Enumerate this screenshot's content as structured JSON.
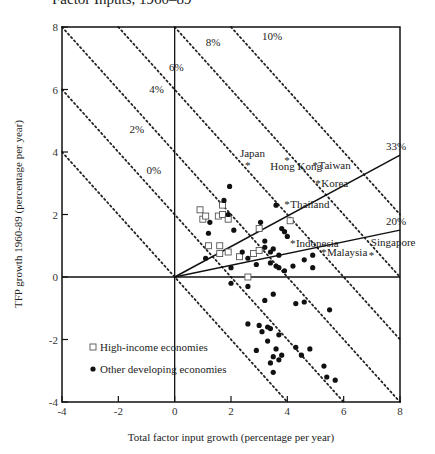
{
  "header": {
    "title": "Factor Inputs, 1960–89"
  },
  "chart_data": {
    "type": "scatter",
    "title": "Factor Inputs, 1960–89",
    "xlabel": "Total factor input growth (percentage per year)",
    "ylabel": "TFP growth 1960-89 (percentage per year)",
    "xlim": [
      -4,
      8
    ],
    "ylim": [
      -4,
      8
    ],
    "xticks": [
      "-4",
      "-2",
      "0",
      "2",
      "4",
      "6",
      "8"
    ],
    "yticks": [
      "-4",
      "-2",
      "0",
      "2",
      "4",
      "6",
      "8"
    ],
    "grid": false,
    "legend": {
      "position": "lower-left",
      "entries": [
        {
          "marker": "open-square",
          "label": "High-income economies"
        },
        {
          "marker": "filled-circle",
          "label": "Other developing economies"
        }
      ]
    },
    "iso_output_lines": [
      {
        "label": "0%",
        "sum": 0
      },
      {
        "label": "2%",
        "sum": 2
      },
      {
        "label": "4%",
        "sum": 4
      },
      {
        "label": "6%",
        "sum": 6
      },
      {
        "label": "8%",
        "sum": 8
      },
      {
        "label": "10%",
        "sum": 10
      }
    ],
    "share_rays": [
      {
        "label": "33%",
        "end": [
          8,
          3.9
        ]
      },
      {
        "label": "20%",
        "end": [
          8,
          1.5
        ]
      }
    ],
    "labeled_points": [
      {
        "name": "Japan",
        "x": 2.6,
        "y": 3.6
      },
      {
        "name": "Hong Kong",
        "x": 4.0,
        "y": 3.75
      },
      {
        "name": "Taiwan",
        "x": 5.0,
        "y": 3.6
      },
      {
        "name": "Korea",
        "x": 5.1,
        "y": 3.0
      },
      {
        "name": "Thailand",
        "x": 4.0,
        "y": 2.35
      },
      {
        "name": "Indonesia",
        "x": 4.2,
        "y": 1.1
      },
      {
        "name": "Malaysia",
        "x": 5.3,
        "y": 0.8
      },
      {
        "name": "Singapore",
        "x": 7.0,
        "y": 0.7
      }
    ],
    "series": [
      {
        "name": "High-income economies",
        "marker": "open-square",
        "points": [
          [
            0.9,
            2.15
          ],
          [
            1.0,
            1.85
          ],
          [
            1.1,
            1.95
          ],
          [
            1.7,
            2.3
          ],
          [
            1.55,
            1.95
          ],
          [
            1.7,
            2.0
          ],
          [
            1.9,
            1.85
          ],
          [
            3.0,
            1.55
          ],
          [
            1.2,
            1.0
          ],
          [
            1.6,
            1.0
          ],
          [
            1.6,
            0.75
          ],
          [
            1.9,
            0.8
          ],
          [
            2.3,
            0.65
          ],
          [
            2.8,
            0.75
          ],
          [
            3.0,
            0.85
          ],
          [
            4.1,
            1.8
          ],
          [
            2.6,
            0.0
          ]
        ]
      },
      {
        "name": "Other developing economies",
        "marker": "filled-circle",
        "points": [
          [
            1.95,
            2.9
          ],
          [
            1.75,
            2.45
          ],
          [
            1.25,
            1.75
          ],
          [
            1.2,
            1.4
          ],
          [
            1.9,
            2.0
          ],
          [
            2.1,
            1.5
          ],
          [
            3.05,
            1.75
          ],
          [
            3.6,
            2.3
          ],
          [
            3.2,
            1.15
          ],
          [
            3.2,
            0.95
          ],
          [
            3.4,
            0.8
          ],
          [
            3.8,
            1.55
          ],
          [
            3.9,
            1.45
          ],
          [
            4.0,
            1.3
          ],
          [
            2.6,
            0.6
          ],
          [
            1.1,
            0.6
          ],
          [
            2.0,
            0.3
          ],
          [
            2.4,
            0.8
          ],
          [
            3.5,
            0.9
          ],
          [
            3.7,
            0.7
          ],
          [
            3.4,
            0.45
          ],
          [
            3.6,
            0.35
          ],
          [
            3.7,
            0.3
          ],
          [
            3.9,
            0.2
          ],
          [
            4.2,
            0.35
          ],
          [
            4.6,
            0.55
          ],
          [
            4.9,
            0.7
          ],
          [
            2.9,
            0.4
          ],
          [
            2.0,
            -0.2
          ],
          [
            4.9,
            0.3
          ],
          [
            2.6,
            -0.3
          ],
          [
            3.2,
            -0.75
          ],
          [
            3.5,
            -0.55
          ],
          [
            4.3,
            -0.85
          ],
          [
            4.6,
            -0.8
          ],
          [
            5.5,
            -1.05
          ],
          [
            2.6,
            -1.5
          ],
          [
            3.0,
            -1.55
          ],
          [
            3.3,
            -1.6
          ],
          [
            3.4,
            -1.65
          ],
          [
            3.1,
            -1.75
          ],
          [
            3.7,
            -1.85
          ],
          [
            3.3,
            -2.05
          ],
          [
            2.9,
            -2.35
          ],
          [
            3.6,
            -2.3
          ],
          [
            3.8,
            -2.5
          ],
          [
            4.3,
            -2.25
          ],
          [
            4.8,
            -2.3
          ],
          [
            3.5,
            -2.55
          ],
          [
            3.7,
            -2.65
          ],
          [
            3.4,
            -2.75
          ],
          [
            3.5,
            -3.05
          ],
          [
            5.3,
            -2.85
          ],
          [
            5.4,
            -3.2
          ],
          [
            4.5,
            -2.5
          ],
          [
            5.7,
            -3.3
          ]
        ]
      }
    ]
  }
}
